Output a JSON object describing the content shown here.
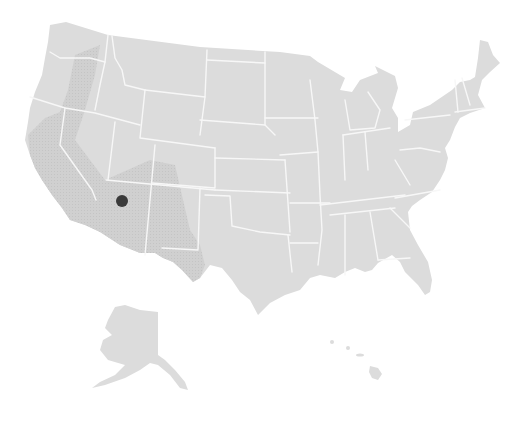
{
  "map": {
    "type": "us-states-choropleth",
    "colors": {
      "background": "#ffffff",
      "land": "#dcdcdc",
      "border": "#f7f7f7",
      "highlight_region": "#cdcdcd",
      "marker": "#3a3a3a"
    },
    "highlight_region": {
      "label": "southwest-region",
      "covers": [
        "eastern Oregon",
        "eastern California",
        "Nevada (west)",
        "Arizona",
        "New Mexico",
        "West Texas"
      ]
    },
    "marker": {
      "label": "location-marker",
      "state": "Arizona",
      "x": 122,
      "y": 201,
      "radius": 6
    },
    "insets": [
      "Alaska",
      "Hawaii"
    ]
  }
}
